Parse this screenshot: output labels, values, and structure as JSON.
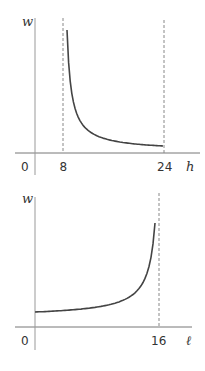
{
  "chart_data": [
    {
      "type": "line",
      "title": "",
      "xlabel": "h",
      "ylabel": "w",
      "xlim": [
        0,
        28
      ],
      "origin_label": "0",
      "x_ticks": [
        {
          "value": 8,
          "label": "8"
        },
        {
          "value": 24,
          "label": "24"
        }
      ],
      "asymptotes": [
        8,
        24
      ],
      "series": [
        {
          "name": "w(h)",
          "shape": "decreasing hyperbola, w = k/(h-c)",
          "x_range": [
            8.5,
            24
          ]
        }
      ],
      "grid": false,
      "legend": "none"
    },
    {
      "type": "line",
      "title": "",
      "xlabel": "ℓ",
      "ylabel": "w",
      "xlim": [
        0,
        18.5
      ],
      "origin_label": "0",
      "x_ticks": [
        {
          "value": 16,
          "label": "16"
        }
      ],
      "asymptotes": [
        16
      ],
      "series": [
        {
          "name": "w(ℓ)",
          "shape": "increasing, w = k/(16-ℓ)",
          "x_range": [
            0,
            15.6
          ]
        }
      ],
      "grid": false,
      "legend": "none"
    }
  ]
}
